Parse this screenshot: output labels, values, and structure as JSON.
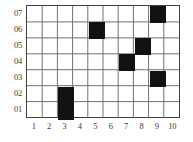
{
  "figure": {
    "name": "occupancy-grid",
    "background_color": "#ffffff",
    "grid_line_color": "#707070",
    "frame_color": "#404040",
    "cell_fill_color": "#121212"
  },
  "chart_data": {
    "type": "heatmap",
    "title": "",
    "subtitle": "",
    "xlabel": "",
    "ylabel": "",
    "grid": true,
    "legend": null,
    "columns": 10,
    "rows": 7,
    "x_tick_labels": [
      "1",
      "2",
      "3",
      "4",
      "5",
      "6",
      "7",
      "8",
      "9",
      "10"
    ],
    "y_tick_labels": [
      "07",
      "06",
      "05",
      "04",
      "03",
      "02",
      "01"
    ],
    "y_tick_labels_bottom_up": [
      "01",
      "02",
      "03",
      "04",
      "05",
      "06",
      "07"
    ],
    "xlim": [
      1,
      10
    ],
    "ylim": [
      1,
      7
    ],
    "value_scale": {
      "filled": 1,
      "empty": 0
    },
    "filled_cells": [
      {
        "x": 9,
        "y": "07",
        "row_index": 0,
        "col_index": 9,
        "value": 1
      },
      {
        "x": 5,
        "y": "06",
        "row_index": 1,
        "col_index": 5,
        "value": 1
      },
      {
        "x": 8,
        "y": "05",
        "row_index": 2,
        "col_index": 8,
        "value": 1
      },
      {
        "x": 7,
        "y": "04",
        "row_index": 3,
        "col_index": 7,
        "value": 1
      },
      {
        "x": 9,
        "y": "03",
        "row_index": 4,
        "col_index": 9,
        "value": 1
      },
      {
        "x": 3,
        "y": "02",
        "row_index": 5,
        "col_index": 3,
        "value": 1
      },
      {
        "x": 3,
        "y": "01",
        "row_index": 6,
        "col_index": 3,
        "value": 1
      }
    ],
    "matrix_top_down": [
      [
        0,
        0,
        0,
        0,
        0,
        0,
        0,
        0,
        1,
        0
      ],
      [
        0,
        0,
        0,
        0,
        1,
        0,
        0,
        0,
        0,
        0
      ],
      [
        0,
        0,
        0,
        0,
        0,
        0,
        0,
        1,
        0,
        0
      ],
      [
        0,
        0,
        0,
        0,
        0,
        0,
        1,
        0,
        0,
        0
      ],
      [
        0,
        0,
        0,
        0,
        0,
        0,
        0,
        0,
        1,
        0
      ],
      [
        0,
        0,
        1,
        0,
        0,
        0,
        0,
        0,
        0,
        0
      ],
      [
        0,
        0,
        1,
        0,
        0,
        0,
        0,
        0,
        0,
        0
      ]
    ],
    "row_labels_for_matrix": [
      "07",
      "06",
      "05",
      "04",
      "03",
      "02",
      "01"
    ],
    "filled_count": 7,
    "total_cells": 70
  }
}
